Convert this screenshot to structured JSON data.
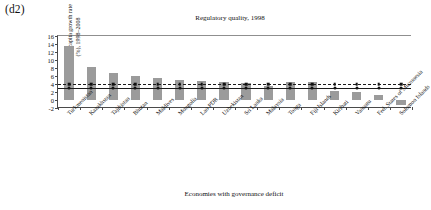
{
  "panel": {
    "label": "(d2)"
  },
  "chart_data": {
    "type": "bar",
    "title": "Regulatory quality, 1998",
    "xlabel": "Economies with governance deficit",
    "ylabel_line1": "GDP per capita growth rate",
    "ylabel_line2": "(%), 1998–2008",
    "ylim": [
      -2,
      16
    ],
    "yticks": [
      -2,
      0,
      2,
      4,
      6,
      8,
      10,
      12,
      14,
      16
    ],
    "ytick_labels": [
      "-2",
      "0",
      "2",
      "4",
      "6",
      "8",
      "10",
      "12",
      "14",
      "16"
    ],
    "grid": false,
    "legend": "none",
    "categories": [
      "Turkmenistan",
      "Kazakhstan",
      "Tajikistan",
      "Bhutan",
      "Maldives",
      "Mongolia",
      "Lao PDR",
      "Uzbekistan",
      "Sri Lanka",
      "Malaysia",
      "Tonga",
      "Fiji Islands",
      "Kiribati",
      "Vanuatu",
      "Fed. States of Micronesia",
      "Solomon Islands"
    ],
    "values": [
      13.5,
      8.2,
      6.8,
      5.9,
      5.6,
      5.0,
      4.7,
      4.5,
      4.3,
      3.4,
      4.6,
      4.5,
      2.2,
      1.9,
      1.2,
      -1.2
    ],
    "reference_lines": [
      {
        "name": "dashed-average",
        "value": 4.0,
        "style": "dashed",
        "marker": "square"
      },
      {
        "name": "solid-average",
        "value": 3.0,
        "style": "solid",
        "marker": "circle"
      }
    ]
  }
}
